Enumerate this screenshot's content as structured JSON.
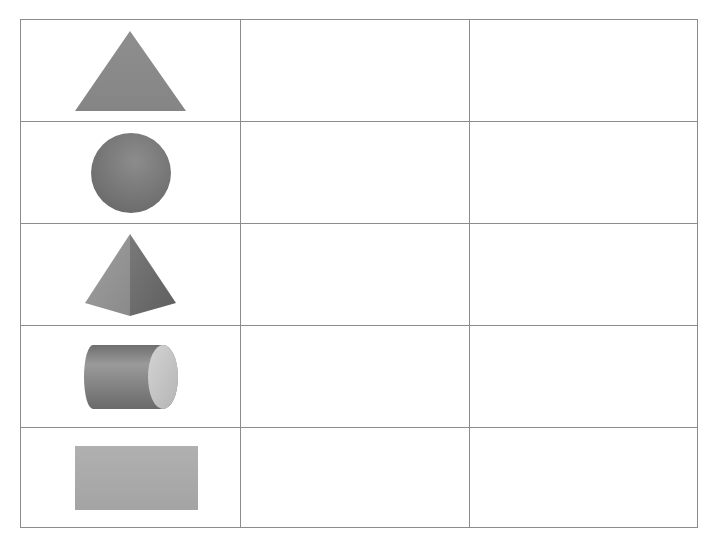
{
  "table": {
    "columns": 3,
    "rows": [
      {
        "shape": "triangle-icon",
        "label": "Triangle",
        "cells": [
          "",
          ""
        ]
      },
      {
        "shape": "circle-icon",
        "label": "Circle",
        "cells": [
          "",
          ""
        ]
      },
      {
        "shape": "pyramid-icon",
        "label": "Pyramid",
        "cells": [
          "",
          ""
        ]
      },
      {
        "shape": "cylinder-icon",
        "label": "Cylinder",
        "cells": [
          "",
          ""
        ]
      },
      {
        "shape": "rectangle-icon",
        "label": "Rectangle",
        "cells": [
          "",
          ""
        ]
      }
    ]
  },
  "colors": {
    "border": "#8c8c8c",
    "shape_fill": "#8a8a8a",
    "shape_dark": "#6e6e6e",
    "shape_light": "#bdbdbd"
  }
}
